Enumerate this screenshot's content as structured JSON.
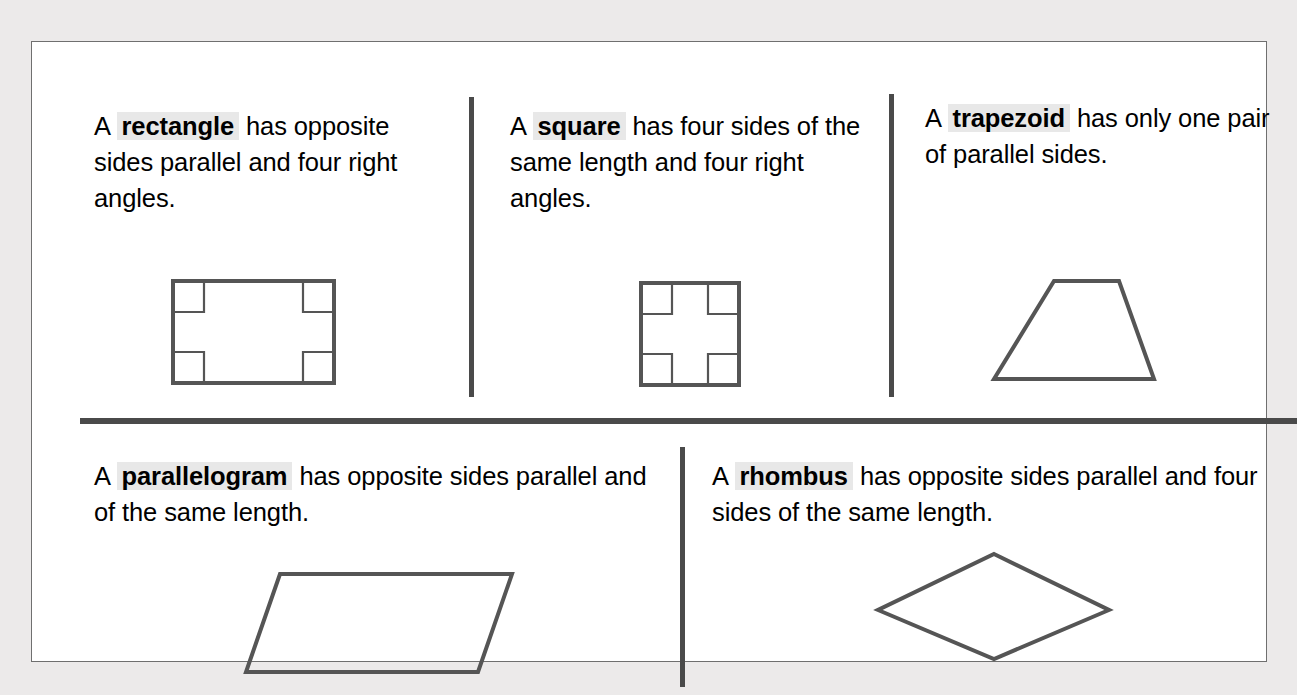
{
  "page": {
    "background_color": "#eceaea",
    "panel_color": "#ffffff",
    "border_color": "#6f6f6f",
    "divider_color": "#4a4a4a",
    "shape_stroke_color": "#555555",
    "term_highlight_color": "#e8e8e8"
  },
  "definitions": [
    {
      "id": "rectangle",
      "lead": "A",
      "term": "rectangle",
      "rest": " has opposite sides parallel and four right angles.",
      "shape": "rectangle-shape",
      "right_angle_markers": 4
    },
    {
      "id": "square",
      "lead": "A",
      "term": "square",
      "rest": " has four sides of the same length and four right angles.",
      "shape": "square-shape",
      "right_angle_markers": 4
    },
    {
      "id": "trapezoid",
      "lead": "A",
      "term": "trapezoid",
      "rest": " has only one pair of parallel sides.",
      "shape": "trapezoid-shape",
      "right_angle_markers": 0
    },
    {
      "id": "parallelogram",
      "lead": "A",
      "term": "parallelogram",
      "rest": " has opposite sides parallel and of the same length.",
      "shape": "parallelogram-shape",
      "right_angle_markers": 0
    },
    {
      "id": "rhombus",
      "lead": "A",
      "term": "rhombus",
      "rest": " has opposite sides parallel and four sides of the same length.",
      "shape": "rhombus-shape",
      "right_angle_markers": 0
    }
  ]
}
